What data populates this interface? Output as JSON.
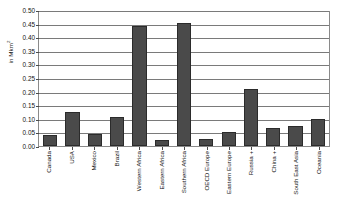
{
  "chart_data": {
    "type": "bar",
    "title": "",
    "subtitle": "",
    "xlabel": "",
    "ylabel": "in Mkm",
    "ylabel_superscript": "2",
    "ylim": [
      0.0,
      0.5
    ],
    "ytick_step": 0.05,
    "grid": true,
    "legend": false,
    "orientation": "vertical",
    "bar_color": "#4a4a4a",
    "bar_edge_color": "#2b2b2b",
    "plot_border_color": "#8a8a8a",
    "gridline_color": "#7a7a7a",
    "background_color": "#ffffff",
    "xtick_labels_rotation": -90,
    "ytick_labels": [
      "0.00",
      "0.05",
      "0.10",
      "0.15",
      "0.20",
      "0.25",
      "0.30",
      "0.35",
      "0.40",
      "0.45",
      "0.50"
    ],
    "categories": [
      "Canada",
      "USA",
      "Mexico",
      "Brazil",
      "Western Africa",
      "Eastern Africa",
      "Southern Africa",
      "OECD Europe",
      "Eastern Europe",
      "Russia +",
      "China +",
      "South East Asia",
      "Oceania"
    ],
    "values": [
      0.039,
      0.125,
      0.043,
      0.105,
      0.44,
      0.022,
      0.452,
      0.026,
      0.052,
      0.208,
      0.065,
      0.074,
      0.1
    ]
  }
}
